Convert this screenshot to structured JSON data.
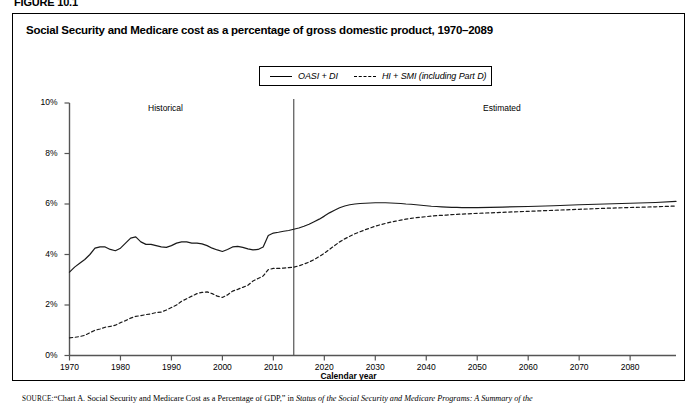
{
  "figure": {
    "tag": "FIGURE 10.1",
    "title": "Social Security and Medicare cost as a percentage of gross domestic product, 1970–2089"
  },
  "legend": {
    "position": "top-center",
    "items": [
      {
        "label": "OASI + DI",
        "style": "solid",
        "icon": "solid-line-icon"
      },
      {
        "label": "HI + SMI (including Part D)",
        "style": "dashed",
        "icon": "dashed-line-icon"
      }
    ]
  },
  "annotations": [
    {
      "text": "Historical",
      "x": 1985
    },
    {
      "text": "Estimated",
      "x": 2053
    }
  ],
  "source": {
    "prefix": "SOURCE:",
    "quoted": "“Chart A. Social Security and Medicare Cost as a Percentage of GDP,”",
    "connector": " in ",
    "italic": "Status of the Social Security and Medicare Programs: A Summary of the"
  },
  "chart_data": {
    "type": "line",
    "title": "Social Security and Medicare cost as a percentage of gross domestic product, 1970–2089",
    "xlabel": "Calendar year",
    "ylabel": "",
    "xlim": [
      1970,
      2089
    ],
    "ylim": [
      0,
      10
    ],
    "grid": false,
    "legend_position": "top-center",
    "xticks": [
      1970,
      1980,
      1990,
      2000,
      2010,
      2020,
      2030,
      2040,
      2050,
      2060,
      2070,
      2080
    ],
    "xticklabels": [
      "1970",
      "1980",
      "1990",
      "2000",
      "2010",
      "2020",
      "2030",
      "2040",
      "2050",
      "2060",
      "2070",
      "2080"
    ],
    "yticks": [
      0,
      2,
      4,
      6,
      8,
      10
    ],
    "yticklabels": [
      "0%",
      "2%",
      "4%",
      "6%",
      "8%",
      "10%"
    ],
    "divider_year": 2014,
    "divider_label_left": "Historical",
    "divider_label_right": "Estimated",
    "series": [
      {
        "name": "OASI + DI",
        "style": "solid",
        "x": [
          1970,
          1971,
          1972,
          1973,
          1974,
          1975,
          1976,
          1977,
          1978,
          1979,
          1980,
          1981,
          1982,
          1983,
          1984,
          1985,
          1986,
          1987,
          1988,
          1989,
          1990,
          1991,
          1992,
          1993,
          1994,
          1995,
          1996,
          1997,
          1998,
          1999,
          2000,
          2001,
          2002,
          2003,
          2004,
          2005,
          2006,
          2007,
          2008,
          2009,
          2010,
          2011,
          2012,
          2013,
          2014,
          2015,
          2016,
          2017,
          2018,
          2019,
          2020,
          2021,
          2022,
          2023,
          2024,
          2025,
          2026,
          2027,
          2028,
          2029,
          2030,
          2031,
          2032,
          2033,
          2034,
          2035,
          2036,
          2037,
          2038,
          2039,
          2040,
          2041,
          2042,
          2043,
          2044,
          2045,
          2046,
          2047,
          2048,
          2049,
          2050,
          2055,
          2060,
          2065,
          2070,
          2075,
          2080,
          2085,
          2089
        ],
        "y": [
          3.3,
          3.5,
          3.65,
          3.8,
          4.0,
          4.25,
          4.3,
          4.3,
          4.2,
          4.15,
          4.25,
          4.45,
          4.65,
          4.7,
          4.5,
          4.4,
          4.4,
          4.35,
          4.3,
          4.28,
          4.35,
          4.45,
          4.5,
          4.5,
          4.45,
          4.45,
          4.42,
          4.35,
          4.25,
          4.18,
          4.12,
          4.2,
          4.3,
          4.32,
          4.28,
          4.22,
          4.18,
          4.2,
          4.3,
          4.75,
          4.85,
          4.88,
          4.92,
          4.95,
          5.0,
          5.05,
          5.12,
          5.2,
          5.3,
          5.4,
          5.52,
          5.65,
          5.75,
          5.85,
          5.92,
          5.97,
          6.0,
          6.02,
          6.03,
          6.04,
          6.05,
          6.05,
          6.05,
          6.04,
          6.03,
          6.02,
          6.0,
          5.99,
          5.97,
          5.95,
          5.93,
          5.91,
          5.9,
          5.89,
          5.88,
          5.87,
          5.87,
          5.86,
          5.86,
          5.86,
          5.86,
          5.88,
          5.9,
          5.93,
          5.97,
          6.0,
          6.03,
          6.06,
          6.1
        ]
      },
      {
        "name": "HI + SMI (including Part D)",
        "style": "dashed",
        "x": [
          1970,
          1971,
          1972,
          1973,
          1974,
          1975,
          1976,
          1977,
          1978,
          1979,
          1980,
          1981,
          1982,
          1983,
          1984,
          1985,
          1986,
          1987,
          1988,
          1989,
          1990,
          1991,
          1992,
          1993,
          1994,
          1995,
          1996,
          1997,
          1998,
          1999,
          2000,
          2001,
          2002,
          2003,
          2004,
          2005,
          2006,
          2007,
          2008,
          2009,
          2010,
          2011,
          2012,
          2013,
          2014,
          2015,
          2016,
          2017,
          2018,
          2019,
          2020,
          2021,
          2022,
          2023,
          2024,
          2025,
          2026,
          2027,
          2028,
          2029,
          2030,
          2031,
          2032,
          2033,
          2034,
          2035,
          2036,
          2037,
          2038,
          2039,
          2040,
          2041,
          2042,
          2043,
          2044,
          2045,
          2046,
          2047,
          2048,
          2049,
          2050,
          2055,
          2060,
          2065,
          2070,
          2075,
          2080,
          2085,
          2089
        ],
        "y": [
          0.7,
          0.72,
          0.75,
          0.8,
          0.9,
          1.0,
          1.05,
          1.12,
          1.15,
          1.2,
          1.3,
          1.38,
          1.48,
          1.55,
          1.58,
          1.62,
          1.65,
          1.7,
          1.72,
          1.8,
          1.9,
          2.0,
          2.15,
          2.25,
          2.35,
          2.45,
          2.5,
          2.52,
          2.45,
          2.35,
          2.3,
          2.4,
          2.55,
          2.62,
          2.7,
          2.78,
          2.95,
          3.05,
          3.15,
          3.4,
          3.45,
          3.45,
          3.46,
          3.48,
          3.5,
          3.55,
          3.62,
          3.7,
          3.8,
          3.92,
          4.05,
          4.2,
          4.35,
          4.5,
          4.62,
          4.72,
          4.82,
          4.9,
          4.98,
          5.05,
          5.12,
          5.18,
          5.23,
          5.28,
          5.32,
          5.36,
          5.4,
          5.43,
          5.46,
          5.48,
          5.5,
          5.52,
          5.54,
          5.55,
          5.56,
          5.58,
          5.59,
          5.6,
          5.61,
          5.62,
          5.63,
          5.67,
          5.71,
          5.75,
          5.79,
          5.83,
          5.86,
          5.89,
          5.92
        ]
      }
    ]
  }
}
